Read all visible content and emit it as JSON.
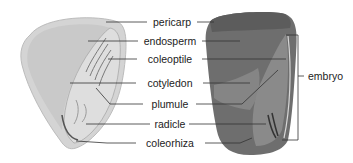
{
  "diagram": {
    "panels": [
      {
        "name": "illustration",
        "style": "drawing"
      },
      {
        "name": "photograph",
        "style": "micrograph"
      }
    ],
    "labels": {
      "pericarp": "pericarp",
      "endosperm": "endosperm",
      "coleoptile": "coleoptile",
      "cotyledon": "cotyledon",
      "plumule": "plumule",
      "radicle": "radicle",
      "coleorhiza": "coleorhiza",
      "embryo": "embryo"
    },
    "colors": {
      "drawing_fill": "#d6d6d6",
      "drawing_shade": "#bdbdbd",
      "photo_dark": "#5a5a5a",
      "photo_mid": "#7a7a7a",
      "leader_line": "#333333"
    }
  }
}
